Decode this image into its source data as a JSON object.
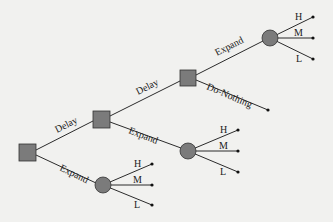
{
  "diagram": {
    "type": "decision-tree",
    "colors": {
      "node_fill": "#7b7b7b",
      "edge": "#2b2b2b",
      "background": "#f1f1ef"
    },
    "nodes": [
      {
        "id": "D1",
        "kind": "decision"
      },
      {
        "id": "D2",
        "kind": "decision"
      },
      {
        "id": "D3",
        "kind": "decision"
      },
      {
        "id": "C1",
        "kind": "chance"
      },
      {
        "id": "C2",
        "kind": "chance"
      },
      {
        "id": "C3",
        "kind": "chance"
      }
    ],
    "edges": [
      {
        "from": "D1",
        "to": "D2",
        "label": "Delay"
      },
      {
        "from": "D1",
        "to": "C1",
        "label": "Expand"
      },
      {
        "from": "D2",
        "to": "D3",
        "label": "Delay"
      },
      {
        "from": "D2",
        "to": "C2",
        "label": "Expand"
      },
      {
        "from": "D3",
        "to": "C3",
        "label": "Expand"
      },
      {
        "from": "D3",
        "to": "T_nothing",
        "label": "Do-Nothing"
      }
    ],
    "outcomes": [
      "H",
      "M",
      "L"
    ]
  }
}
